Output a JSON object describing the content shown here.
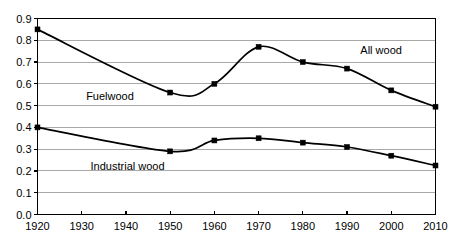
{
  "chart_data": {
    "type": "line",
    "title": "",
    "subtitle": "",
    "xlabel": "",
    "ylabel": "",
    "x": [
      1920,
      1930,
      1940,
      1950,
      1960,
      1970,
      1980,
      1990,
      2000,
      2010
    ],
    "xlim": [
      1920,
      2010
    ],
    "ylim": [
      0.0,
      0.9
    ],
    "y_ticks": [
      "0.0",
      "0.1",
      "0.2",
      "0.3",
      "0.4",
      "0.5",
      "0.6",
      "0.7",
      "0.8",
      "0.9"
    ],
    "y_tick_values": [
      0.0,
      0.1,
      0.2,
      0.3,
      0.4,
      0.5,
      0.6,
      0.7,
      0.8,
      0.9
    ],
    "x_ticks": [
      "1920",
      "1930",
      "1940",
      "1950",
      "1960",
      "1970",
      "1980",
      "1990",
      "2000",
      "2010"
    ],
    "grid": "horizontal",
    "legend_position": "inline-annotations",
    "marker": "filled-square",
    "line_color": "#000000",
    "grid_color": "#a8a8a8",
    "axis_color": "#000000",
    "background_color": "#ffffff",
    "series": [
      {
        "name": "All wood",
        "annotation": "All wood",
        "annotation_x": 1993,
        "annotation_y": 0.735,
        "x": [
          1920,
          1950,
          1960,
          1970,
          1980,
          1990,
          2000,
          2010
        ],
        "values": [
          0.85,
          0.56,
          0.6,
          0.77,
          0.7,
          0.67,
          0.57,
          0.495
        ]
      },
      {
        "name": "Fuelwood",
        "annotation": "Fuelwood",
        "annotation_x": 1931,
        "annotation_y": 0.525,
        "x": [],
        "values": []
      },
      {
        "name": "Industrial wood",
        "annotation": "Industrial wood",
        "annotation_x": 1932,
        "annotation_y": 0.205,
        "x": [
          1920,
          1950,
          1960,
          1970,
          1980,
          1990,
          2000,
          2010
        ],
        "values": [
          0.4,
          0.29,
          0.34,
          0.35,
          0.33,
          0.31,
          0.27,
          0.225
        ]
      }
    ]
  }
}
